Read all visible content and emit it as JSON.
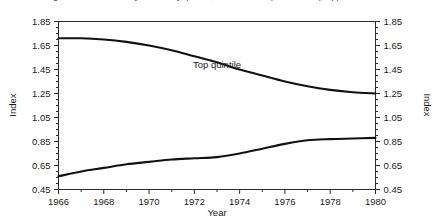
{
  "figure": {
    "clipped_caption": "Figure 1. Index of family income by quintile, 1966 to 1980 (1966 = 1.00), upper and lower quintiles"
  },
  "chart_data": {
    "type": "line",
    "title": "",
    "xlabel": "Year",
    "ylabel": "Index",
    "ylabel_right": "Index",
    "xlim": [
      1966,
      1980
    ],
    "ylim": [
      0.45,
      1.85
    ],
    "grid": false,
    "legend_position": "inline-annotation",
    "x_ticks_major": [
      1966,
      1968,
      1970,
      1972,
      1974,
      1976,
      1978,
      1980
    ],
    "x_ticks_minor": [
      1967,
      1969,
      1971,
      1973,
      1975,
      1977,
      1979
    ],
    "x_tick_labels": [
      "1966",
      "1968",
      "1970",
      "1972",
      "1974",
      "1976",
      "1978",
      "1980"
    ],
    "y_ticks_major": [
      0.45,
      0.65,
      0.85,
      1.05,
      1.25,
      1.45,
      1.65,
      1.85
    ],
    "y_tick_labels": [
      "0.45",
      "0.65",
      "0.85",
      "1.05",
      "1.25",
      "1.45",
      "1.65",
      "1.85"
    ],
    "y_ticks_minor": [
      0.5,
      0.55,
      0.6,
      0.7,
      0.75,
      0.8,
      0.9,
      0.95,
      1.0,
      1.1,
      1.15,
      1.2,
      1.3,
      1.35,
      1.4,
      1.5,
      1.55,
      1.6,
      1.7,
      1.75,
      1.8
    ],
    "annotations": [
      {
        "text": "Top quintile",
        "x": 1973.0,
        "y": 1.46
      }
    ],
    "x": [
      1966,
      1967,
      1968,
      1969,
      1970,
      1971,
      1972,
      1973,
      1974,
      1975,
      1976,
      1977,
      1978,
      1979,
      1980
    ],
    "series": [
      {
        "name": "Top quintile",
        "color": "#111111",
        "values": [
          1.71,
          1.71,
          1.7,
          1.68,
          1.65,
          1.61,
          1.56,
          1.51,
          1.45,
          1.4,
          1.35,
          1.31,
          1.28,
          1.26,
          1.25
        ]
      },
      {
        "name": "Bottom quintile",
        "color": "#111111",
        "values": [
          0.56,
          0.6,
          0.63,
          0.66,
          0.68,
          0.7,
          0.71,
          0.72,
          0.75,
          0.79,
          0.83,
          0.86,
          0.87,
          0.875,
          0.88
        ]
      }
    ]
  }
}
